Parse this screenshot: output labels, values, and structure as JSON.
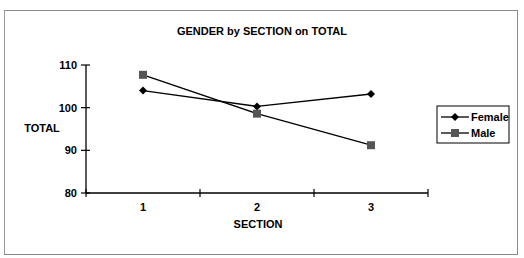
{
  "chart_data": {
    "type": "line",
    "title": "GENDER by SECTION on TOTAL",
    "xlabel": "SECTION",
    "ylabel": "TOTAL",
    "categories": [
      "1",
      "2",
      "3"
    ],
    "series": [
      {
        "name": "Female",
        "marker": "diamond",
        "color": "#000000",
        "values": [
          104.0,
          100.3,
          103.2
        ]
      },
      {
        "name": "Male",
        "marker": "square",
        "color": "#555555",
        "values": [
          107.7,
          98.6,
          91.2
        ]
      }
    ],
    "ylim": [
      80,
      110
    ],
    "yticks": [
      "80",
      "90",
      "100",
      "110"
    ],
    "grid": false,
    "legend_position": "right"
  }
}
